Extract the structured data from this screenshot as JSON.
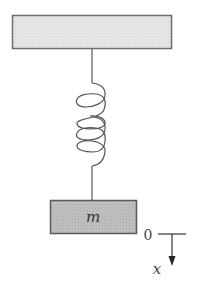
{
  "diagram": {
    "support": {
      "fill": "#e6e6e6",
      "stroke": "#6e6e6e"
    },
    "mass": {
      "label": "m",
      "fill": "#bdbdbd",
      "stroke": "#5a5a5a"
    },
    "spring": {
      "coils": 3,
      "stroke": "#555555"
    },
    "axis": {
      "origin_label": "0",
      "direction_label": "x",
      "stroke": "#333333"
    }
  }
}
